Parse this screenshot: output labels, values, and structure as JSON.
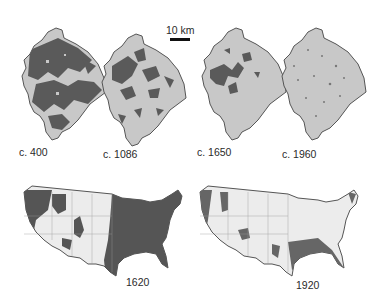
{
  "scale_bar": {
    "label": "10 km"
  },
  "colors": {
    "forest": "#5a5a5a",
    "land": "#c8c8c8",
    "outline": "#555555",
    "us_land": "#ececec",
    "us_forest": "#555555"
  },
  "local_maps": [
    {
      "label": "c. 400"
    },
    {
      "label": "c. 1086"
    },
    {
      "label": "c. 1650"
    },
    {
      "label": "c. 1960"
    }
  ],
  "us_maps": [
    {
      "label": "1620"
    },
    {
      "label": "1920"
    }
  ]
}
